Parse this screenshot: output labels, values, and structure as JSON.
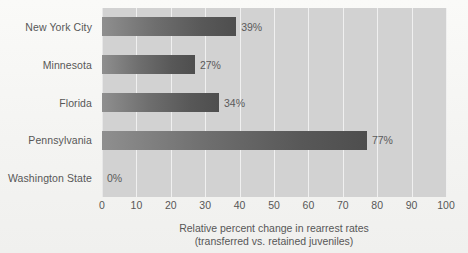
{
  "chart_data": {
    "type": "bar",
    "orientation": "horizontal",
    "title": "",
    "categories": [
      "New York City",
      "Minnesota",
      "Florida",
      "Pennsylvania",
      "Washington State"
    ],
    "values": [
      39,
      27,
      34,
      77,
      0
    ],
    "value_labels": [
      "39%",
      "27%",
      "34%",
      "77%",
      "0%"
    ],
    "xlabel_line1": "Relative percent change in rearrest rates",
    "xlabel_line2": "(transferred vs. retained juveniles)",
    "ylabel": "",
    "xlim": [
      0,
      100
    ],
    "xticks": [
      0,
      10,
      20,
      30,
      40,
      50,
      60,
      70,
      80,
      90,
      100
    ],
    "xtick_labels": [
      "0",
      "10",
      "20",
      "30",
      "40",
      "50",
      "60",
      "70",
      "80",
      "90",
      "100"
    ],
    "grid": true,
    "grid_axis": "x",
    "legend": "none",
    "colors": {
      "bar_light": "#8f8f8f",
      "bar_dark": "#4e4e4e",
      "plot_background": "#d2d2d2",
      "gridline": "#f0f0f0",
      "figure_background": "#f6f6f4",
      "text": "#575757"
    }
  }
}
